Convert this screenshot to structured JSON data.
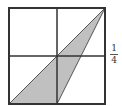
{
  "figure": {
    "square": {
      "x": 9,
      "y": 8,
      "size": 96
    },
    "shaded_triangle": {
      "vertices": [
        [
          9,
          104
        ],
        [
          105,
          8
        ],
        [
          57,
          104
        ]
      ],
      "fill": "#c0c0c0"
    },
    "grid_lines": "midlines",
    "stroke_color": "#333333"
  },
  "label": {
    "numerator": "1",
    "denominator": "4"
  }
}
